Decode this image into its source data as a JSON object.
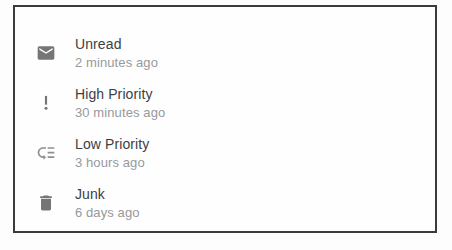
{
  "colors": {
    "background": "#fdfdfd",
    "panel_bg": "#fefefe",
    "border": "#3b3b3b",
    "title_text": "#3d4043",
    "subtitle_text": "#97999c",
    "icon": "#757575"
  },
  "panel": {
    "list": {
      "items": [
        {
          "icon": "email-icon",
          "label": "Unread",
          "timestamp": "2 minutes ago"
        },
        {
          "icon": "priority-high-icon",
          "label": "High Priority",
          "timestamp": "30 minutes ago"
        },
        {
          "icon": "low-priority-icon",
          "label": "Low Priority",
          "timestamp": "3 hours ago"
        },
        {
          "icon": "delete-icon",
          "label": "Junk",
          "timestamp": "6 days ago"
        }
      ]
    }
  }
}
